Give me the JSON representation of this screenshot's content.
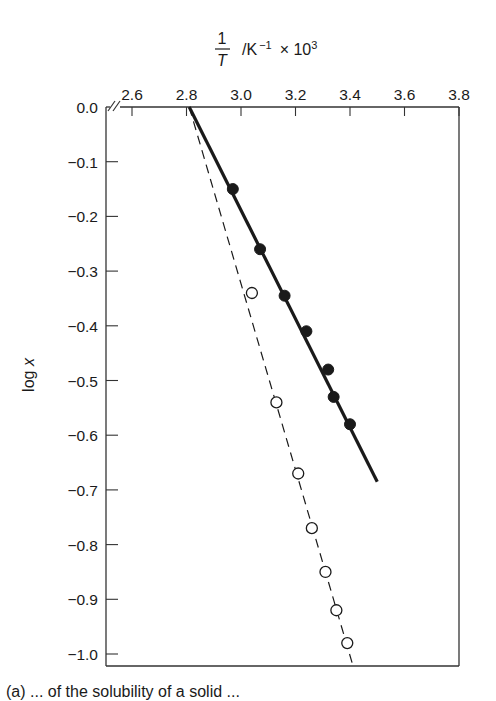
{
  "chart_data": {
    "type": "scatter",
    "title": "",
    "xlabel": "1/T /K⁻¹ × 10³",
    "xlabel_parts": {
      "numerator": "1",
      "denominator": "T",
      "units": "/K",
      "exp1": "−1",
      "times": "× 10",
      "exp2": "3"
    },
    "ylabel": "log x",
    "ylabel_parts": {
      "prefix": "log ",
      "var": "x"
    },
    "x_axis_position": "top",
    "xlim": [
      2.6,
      3.8
    ],
    "ylim": [
      -1.0,
      0.0
    ],
    "x_axis_break": true,
    "grid": false,
    "xticks": [
      2.6,
      2.8,
      3.0,
      3.2,
      3.4,
      3.6,
      3.8
    ],
    "xtick_labels": [
      "2.6",
      "2.8",
      "3.0",
      "3.2",
      "3.4",
      "3.6",
      "3.8"
    ],
    "yticks": [
      0.0,
      -0.1,
      -0.2,
      -0.3,
      -0.4,
      -0.5,
      -0.6,
      -0.7,
      -0.8,
      -0.9,
      -1.0
    ],
    "ytick_labels": [
      "0.0",
      "−0.1",
      "−0.2",
      "−0.3",
      "−0.4",
      "−0.5",
      "−0.6",
      "−0.7",
      "−0.8",
      "−0.9",
      "−1.0"
    ],
    "series": [
      {
        "name": "filled circles",
        "marker": "filled-circle",
        "line_style": "solid",
        "x": [
          2.97,
          3.07,
          3.16,
          3.24,
          3.32,
          3.34,
          3.4
        ],
        "y": [
          -0.15,
          -0.26,
          -0.345,
          -0.41,
          -0.48,
          -0.53,
          -0.58
        ],
        "fit_line": {
          "x": [
            2.81,
            3.5
          ],
          "y": [
            0.0,
            -0.685
          ]
        }
      },
      {
        "name": "open circles",
        "marker": "open-circle",
        "line_style": "dashed",
        "x": [
          3.04,
          3.13,
          3.21,
          3.26,
          3.31,
          3.35,
          3.39
        ],
        "y": [
          -0.34,
          -0.54,
          -0.67,
          -0.77,
          -0.85,
          -0.92,
          -0.98
        ],
        "fit_line": {
          "x": [
            2.81,
            3.41
          ],
          "y": [
            0.0,
            -1.02
          ]
        }
      }
    ],
    "legend": null
  },
  "caption_partial": "(a) ... of the solubility of a solid ..."
}
